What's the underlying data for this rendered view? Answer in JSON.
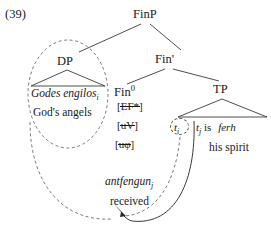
{
  "figure": {
    "example_number": "(39)",
    "type": "syntactic-tree-diagram"
  },
  "nodes": {
    "root": "FinP",
    "dp": "DP",
    "fin_bar": "Fin'",
    "fin_head": "Fin",
    "fin_head_superscript": "0",
    "tp": "TP"
  },
  "dp_phrase": {
    "old_english": "Godes engilos",
    "index": "i",
    "gloss": "God's angels"
  },
  "fin_features": [
    {
      "text": "EF*",
      "struck": true,
      "open_bracket": "[",
      "close_bracket": "]"
    },
    {
      "text": "uV",
      "struck": true,
      "open_bracket": "[",
      "close_bracket": "]"
    },
    {
      "text": "uφ",
      "struck": true,
      "open_bracket": "[",
      "close_bracket": "]"
    }
  ],
  "verb": {
    "old_english": "antfengun",
    "index": "j",
    "gloss": "received"
  },
  "tp_contents": {
    "trace_subject": "t",
    "trace_subject_index": "i",
    "trace_verb": "t",
    "trace_verb_index": "j",
    "copula": "is",
    "object_old_english": "ferh",
    "object_gloss": "his spirit"
  },
  "colors": {
    "background": "#ffffff",
    "text": "#1a1a1a",
    "branch": "#3a3a3a",
    "dashed": "#6a6a6a"
  }
}
